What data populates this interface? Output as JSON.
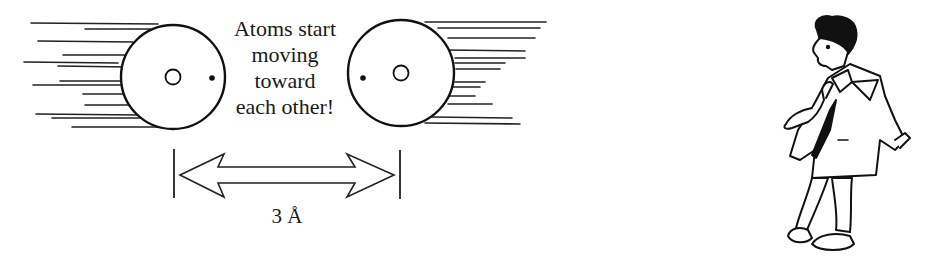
{
  "figure": {
    "caption_lines": [
      "Atoms start",
      "moving",
      "toward",
      "each other!"
    ],
    "distance_label": "3 Å",
    "atoms": [
      {
        "name": "left-atom",
        "cx": 173,
        "cy": 77,
        "r": 52,
        "nucleus_r": 7,
        "electron": [
          212,
          78
        ],
        "motion_lines_side": "left"
      },
      {
        "name": "right-atom",
        "cx": 401,
        "cy": 73,
        "r": 53,
        "nucleus_r": 7,
        "electron": [
          363,
          78
        ],
        "motion_lines_side": "right"
      }
    ],
    "colors": {
      "ink": "#111111",
      "background": "#ffffff"
    },
    "illustration": "cartoon-man-thinking"
  }
}
